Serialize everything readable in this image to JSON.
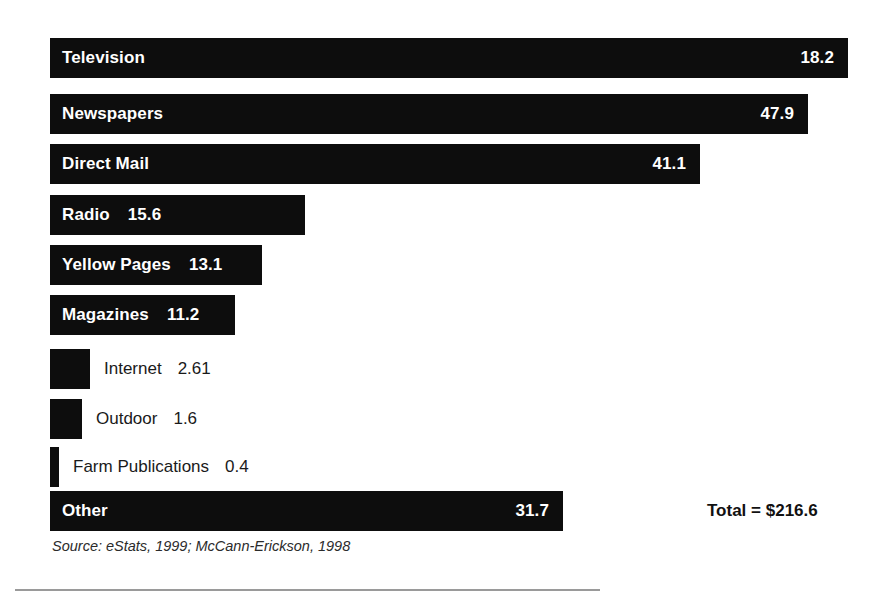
{
  "chart_data": {
    "type": "bar",
    "orientation": "horizontal",
    "title": "",
    "xlabel": "",
    "ylabel": "",
    "grid": false,
    "legend": null,
    "axis_visible": false,
    "value_label_format": "one-decimal",
    "categories": [
      "Television",
      "Newspapers",
      "Direct Mail",
      "Radio",
      "Yellow Pages",
      "Magazines",
      "Internet",
      "Outdoor",
      "Farm Publications",
      "Other"
    ],
    "values": [
      18.2,
      47.9,
      41.1,
      15.6,
      13.1,
      11.2,
      2.61,
      1.6,
      0.4,
      31.7
    ],
    "value_labels": [
      "18.2",
      "47.9",
      "41.1",
      "15.6",
      "13.1",
      "11.2",
      "2.61",
      "1.6",
      "0.4",
      "31.7"
    ],
    "total_label": "Total = $216.6",
    "total_value": 216.6,
    "source": "Source: eStats, 1999; McCann-Erickson, 1998",
    "bars": [
      {
        "category": "Television",
        "value_label": "18.2",
        "label_placement": "inside",
        "x": 50,
        "y": 38,
        "w": 798,
        "h": 40
      },
      {
        "category": "Newspapers",
        "value_label": "47.9",
        "label_placement": "inside",
        "x": 50,
        "y": 94,
        "w": 758,
        "h": 40
      },
      {
        "category": "Direct Mail",
        "value_label": "41.1",
        "label_placement": "inside",
        "x": 50,
        "y": 144,
        "w": 650,
        "h": 40
      },
      {
        "category": "Radio",
        "value_label": "15.6",
        "label_placement": "inside-tight",
        "x": 50,
        "y": 195,
        "w": 255,
        "h": 40
      },
      {
        "category": "Yellow Pages",
        "value_label": "13.1",
        "label_placement": "inside-tight",
        "x": 50,
        "y": 245,
        "w": 212,
        "h": 40
      },
      {
        "category": "Magazines",
        "value_label": "11.2",
        "label_placement": "inside-tight",
        "x": 50,
        "y": 295,
        "w": 185,
        "h": 40
      },
      {
        "category": "Internet",
        "value_label": "2.61",
        "label_placement": "outside",
        "x": 50,
        "y": 349,
        "w": 40,
        "h": 40
      },
      {
        "category": "Outdoor",
        "value_label": "1.6",
        "label_placement": "outside",
        "x": 50,
        "y": 399,
        "w": 32,
        "h": 40
      },
      {
        "category": "Farm Publications",
        "value_label": "0.4",
        "label_placement": "outside",
        "x": 50,
        "y": 447,
        "w": 9,
        "h": 40
      },
      {
        "category": "Other",
        "value_label": "31.7",
        "label_placement": "inside",
        "x": 50,
        "y": 491,
        "w": 513,
        "h": 40
      }
    ],
    "total_annotation": {
      "x": 707,
      "y": 491,
      "h": 40
    },
    "colors": {
      "bar": "#0d0d0d",
      "inside_label": "#ffffff",
      "outside_label": "#1a1a1a",
      "background": "#ffffff",
      "rule": "#9a9a9a"
    }
  }
}
